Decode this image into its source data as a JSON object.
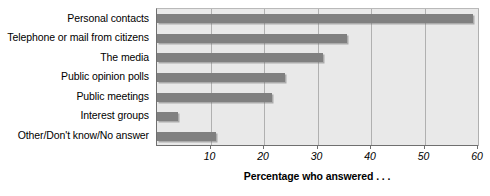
{
  "chart_data": {
    "type": "bar",
    "orientation": "horizontal",
    "title": "",
    "subtitle": "",
    "xlabel": "Percentage who answered . . .",
    "ylabel": "",
    "xlim": [
      0,
      60
    ],
    "xticks": [
      10,
      20,
      30,
      40,
      50,
      60
    ],
    "xtick_labels": [
      "10",
      "20",
      "30",
      "40",
      "50",
      "60"
    ],
    "grid": true,
    "gridlines_axis": "x",
    "legend": false,
    "legend_position": "none",
    "categories": [
      "Personal contacts",
      "Telephone or mail from citizens",
      "The media",
      "Public opinion polls",
      "Public meetings",
      "Interest groups",
      "Other/Don't know/No answer"
    ],
    "values": [
      59,
      35.5,
      31,
      24,
      21.5,
      4,
      11
    ],
    "bar_color": "#808080",
    "plot_background": "#e9e9e9",
    "page_background": "#ffffff",
    "axis_color": "#6f6f6f",
    "gridline_color": "#b0b0b0"
  }
}
